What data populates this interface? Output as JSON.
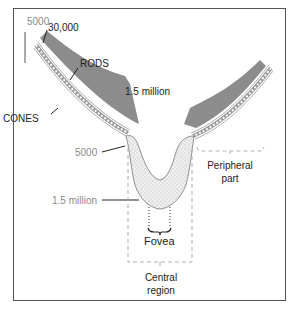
{
  "diagram": {
    "type": "retina cross-section (rods and cones distribution)",
    "labels": {
      "cones_periphery_count": "5000",
      "rods_periphery_count": "30,000",
      "rods": "RODS",
      "rods_total": "1.5 million",
      "cones": "CONES",
      "cones_fovea_edge_count": "5000",
      "cones_fovea_count": "1.5 million",
      "fovea": "Fovea",
      "peripheral_line1": "Peripheral",
      "peripheral_line2": "part",
      "central_line1": "Central",
      "central_line2": "region"
    },
    "colors": {
      "rods_fill": "#8c8c8c",
      "cones_band": "#b5b5b5",
      "fovea_fill": "#eeeeee",
      "stipple": "#777777",
      "dashed_guides": "#b0b0b0",
      "frame": "#555555",
      "dark_text": "#222222",
      "grey_text": "#8a8a8a"
    }
  }
}
